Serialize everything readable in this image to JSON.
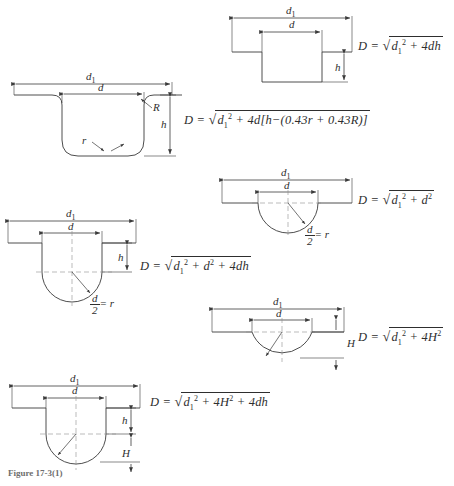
{
  "figure": {
    "caption": "Figure 17-3(1)",
    "line_color": "#3a3a3a",
    "dash_color": "#8d8d8d",
    "text_color": "#2e2e2e"
  },
  "items": [
    {
      "id": "rect-groove",
      "shape": "rectangular-groove",
      "labels": {
        "d1": "d",
        "d1sub": "1",
        "d": "d",
        "h": "h"
      },
      "equation": {
        "lhs": "D =",
        "terms": "d₁² + 4dh",
        "plain": "D = sqrt(d1^2 + 4dh)"
      }
    },
    {
      "id": "filleted-groove",
      "shape": "filleted-groove",
      "labels": {
        "d1": "d",
        "d1sub": "1",
        "d": "d",
        "h": "h",
        "R": "R",
        "r": "r"
      },
      "equation": {
        "lhs": "D =",
        "terms": "d₁² + 4d[h−(0.43r + 0.43R)]",
        "plain": "D = sqrt(d1^2 + 4d[h-(0.43r + 0.43R)])"
      }
    },
    {
      "id": "semicircular-groove",
      "shape": "semicircular-groove",
      "labels": {
        "d1": "d",
        "d1sub": "1",
        "d": "d",
        "radius_note_num": "d",
        "radius_note_den": "2",
        "radius_note_eq": "= r"
      },
      "equation": {
        "lhs": "D =",
        "terms": "d₁² + d²",
        "plain": "D = sqrt(d1^2 + d^2)"
      }
    },
    {
      "id": "u-groove",
      "shape": "u-groove",
      "labels": {
        "d1": "d",
        "d1sub": "1",
        "d": "d",
        "h": "h",
        "radius_note_num": "d",
        "radius_note_den": "2",
        "radius_note_eq": "= r"
      },
      "equation": {
        "lhs": "D =",
        "terms": "d₁² + d² + 4dh",
        "plain": "D = sqrt(d1^2 + d^2 + 4dh)"
      }
    },
    {
      "id": "shallow-arc-groove",
      "shape": "shallow-arc-groove",
      "labels": {
        "d1": "d",
        "d1sub": "1",
        "d": "d",
        "H": "H"
      },
      "equation": {
        "lhs": "D =",
        "terms": "d₁² + 4H²",
        "plain": "D = sqrt(d1^2 + 4H^2)"
      }
    },
    {
      "id": "u-groove-with-arc",
      "shape": "u-groove-with-arc",
      "labels": {
        "d1": "d",
        "d1sub": "1",
        "d": "d",
        "h": "h",
        "H": "H"
      },
      "equation": {
        "lhs": "D =",
        "terms": "d₁² + 4H² + 4dh",
        "plain": "D = sqrt(d1^2 + 4H^2 + 4dh)"
      }
    }
  ]
}
